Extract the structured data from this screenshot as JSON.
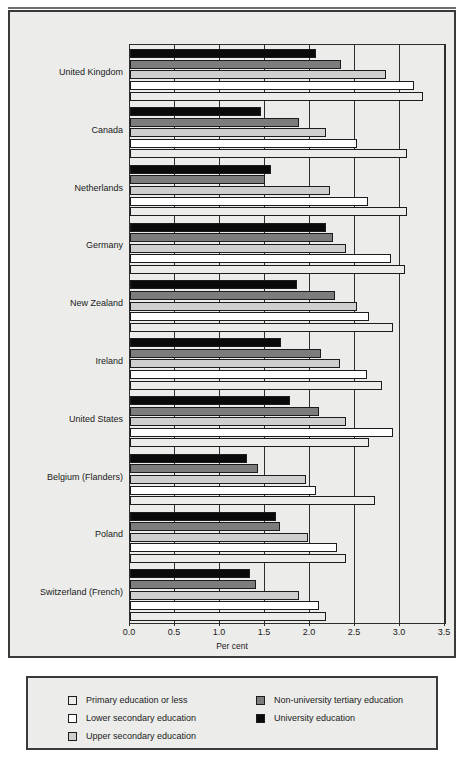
{
  "axis": {
    "xlabel": "Per cent",
    "ticks": [
      "0.0",
      "0.5",
      "1.0",
      "1.5",
      "2.0",
      "2.5",
      "3.0",
      "3.5"
    ]
  },
  "legend": {
    "left": [
      {
        "label": "Primary education or less",
        "color": "#ececea"
      },
      {
        "label": "Lower secondary education",
        "color": "#ffffff"
      },
      {
        "label": "Upper secondary education",
        "color": "#cfcfcf"
      }
    ],
    "right": [
      {
        "label": "Non-university tertiary education",
        "color": "#7c7c7c"
      },
      {
        "label": "University education",
        "color": "#0a0a0a"
      }
    ]
  },
  "chart_data": {
    "type": "bar",
    "orientation": "horizontal",
    "title": "",
    "xlabel": "Per cent",
    "ylabel": "",
    "xlim": [
      0.0,
      3.5
    ],
    "xticks": [
      0.0,
      0.5,
      1.0,
      1.5,
      2.0,
      2.5,
      3.0,
      3.5
    ],
    "grid": true,
    "legend_position": "bottom",
    "categories": [
      "United Kingdom",
      "Canada",
      "Netherlands",
      "Germany",
      "New Zealand",
      "Ireland",
      "United States",
      "Belgium (Flanders)",
      "Poland",
      "Switzerland (French)"
    ],
    "series": [
      {
        "name": "University education",
        "color": "#0a0a0a",
        "values": [
          2.07,
          1.45,
          1.57,
          2.18,
          1.85,
          1.68,
          1.78,
          1.3,
          1.62,
          1.33
        ]
      },
      {
        "name": "Non-university tertiary education",
        "color": "#7c7c7c",
        "values": [
          2.34,
          1.88,
          1.5,
          2.25,
          2.28,
          2.12,
          2.1,
          1.42,
          1.67,
          1.4
        ]
      },
      {
        "name": "Upper secondary education",
        "color": "#cfcfcf",
        "values": [
          2.84,
          2.18,
          2.22,
          2.4,
          2.52,
          2.33,
          2.4,
          1.95,
          1.98,
          1.88
        ]
      },
      {
        "name": "Lower secondary education",
        "color": "#ffffff",
        "values": [
          3.16,
          2.52,
          2.64,
          2.9,
          2.65,
          2.63,
          2.92,
          2.07,
          2.3,
          2.1
        ]
      },
      {
        "name": "Primary education or less",
        "color": "#ececea",
        "values": [
          3.25,
          3.08,
          3.08,
          3.05,
          2.92,
          2.8,
          2.65,
          2.72,
          2.4,
          2.18
        ]
      }
    ],
    "series_draw_order": [
      "University education",
      "Non-university tertiary education",
      "Upper secondary education",
      "Lower secondary education",
      "Primary education or less"
    ]
  }
}
